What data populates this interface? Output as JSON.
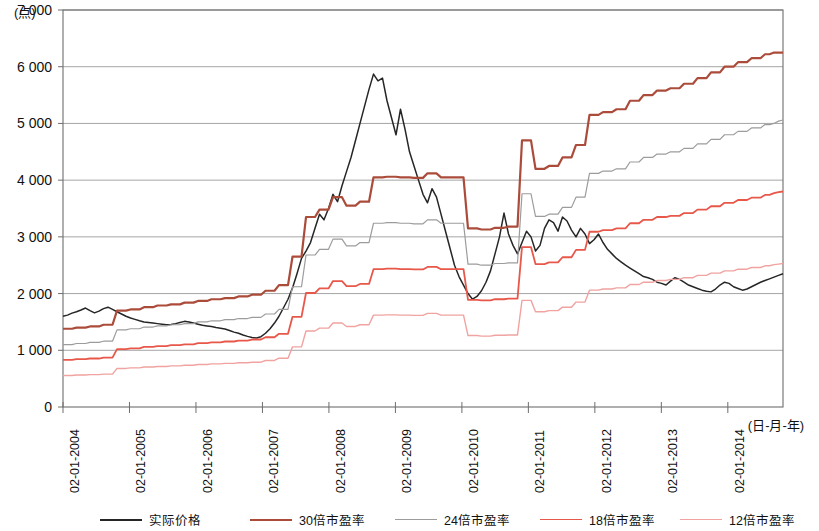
{
  "chart_data": {
    "type": "line",
    "title": "",
    "subtitle": "",
    "ylabel": "(点)",
    "xlabel": "(日-月-年)",
    "ylim": [
      0,
      7000
    ],
    "yticks": [
      0,
      1000,
      2000,
      3000,
      4000,
      5000,
      6000,
      7000
    ],
    "ytick_labels": [
      "0",
      "1 000",
      "2 000",
      "3 000",
      "4 000",
      "5 000",
      "6 000",
      "7 000"
    ],
    "xtick_labels": [
      "02-01-2004",
      "02-01-2005",
      "02-01-2006",
      "02-01-2007",
      "02-01-2008",
      "02-01-2009",
      "02-01-2010",
      "02-01-2011",
      "02-01-2012",
      "02-01-2013",
      "02-01-2014"
    ],
    "x_start_year": 2004.0,
    "x_end_year": 2014.83,
    "grid": "horizontal",
    "legend_position": "bottom",
    "series": [
      {
        "name": "实际价格",
        "color": "#262626",
        "width": 1.5,
        "values": [
          1600,
          1620,
          1655,
          1680,
          1710,
          1745,
          1700,
          1660,
          1690,
          1735,
          1760,
          1720,
          1680,
          1640,
          1600,
          1570,
          1545,
          1520,
          1500,
          1490,
          1480,
          1470,
          1460,
          1450,
          1455,
          1470,
          1490,
          1510,
          1500,
          1480,
          1460,
          1440,
          1430,
          1420,
          1400,
          1390,
          1375,
          1350,
          1320,
          1300,
          1270,
          1245,
          1225,
          1215,
          1240,
          1300,
          1380,
          1480,
          1600,
          1750,
          1900,
          2100,
          2350,
          2620,
          2750,
          2900,
          3150,
          3400,
          3300,
          3500,
          3750,
          3620,
          3900,
          4150,
          4400,
          4700,
          5000,
          5300,
          5600,
          5870,
          5750,
          5800,
          5400,
          5100,
          4800,
          5250,
          4900,
          4500,
          4250,
          4000,
          3750,
          3600,
          3850,
          3700,
          3400,
          3100,
          2800,
          2500,
          2300,
          2150,
          2000,
          1900,
          1950,
          2050,
          2200,
          2400,
          2700,
          3000,
          3420,
          3050,
          2850,
          2700,
          2900,
          3100,
          3000,
          2750,
          2850,
          3150,
          3300,
          3250,
          3100,
          3350,
          3280,
          3120,
          3000,
          3150,
          3050,
          2880,
          2950,
          3050,
          2900,
          2780,
          2700,
          2620,
          2560,
          2500,
          2450,
          2400,
          2350,
          2300,
          2280,
          2250,
          2200,
          2180,
          2150,
          2220,
          2280,
          2250,
          2200,
          2150,
          2120,
          2090,
          2060,
          2040,
          2030,
          2080,
          2150,
          2200,
          2180,
          2120,
          2090,
          2060,
          2080,
          2120,
          2160,
          2200,
          2230,
          2260,
          2290,
          2320,
          2350
        ]
      },
      {
        "name": "30倍市盈率",
        "color": "#ab4c3b",
        "width": 2.2,
        "values": [
          1380,
          1380,
          1380,
          1400,
          1400,
          1400,
          1420,
          1420,
          1420,
          1450,
          1450,
          1450,
          1700,
          1700,
          1700,
          1720,
          1720,
          1720,
          1760,
          1760,
          1760,
          1790,
          1790,
          1790,
          1810,
          1810,
          1810,
          1840,
          1840,
          1840,
          1870,
          1870,
          1870,
          1900,
          1900,
          1900,
          1920,
          1920,
          1920,
          1950,
          1950,
          1950,
          1980,
          1980,
          1980,
          2050,
          2050,
          2050,
          2150,
          2150,
          2150,
          2650,
          2650,
          2650,
          3350,
          3350,
          3350,
          3480,
          3480,
          3480,
          3700,
          3700,
          3700,
          3550,
          3550,
          3550,
          3620,
          3620,
          3620,
          4050,
          4050,
          4050,
          4060,
          4060,
          4060,
          4050,
          4050,
          4050,
          4040,
          4040,
          4040,
          4120,
          4120,
          4120,
          4050,
          4050,
          4050,
          4050,
          4050,
          4050,
          3150,
          3150,
          3150,
          3130,
          3130,
          3130,
          3160,
          3160,
          3160,
          3180,
          3180,
          3180,
          4700,
          4700,
          4700,
          4200,
          4200,
          4200,
          4250,
          4250,
          4250,
          4400,
          4400,
          4400,
          4620,
          4620,
          4620,
          5150,
          5150,
          5150,
          5200,
          5200,
          5200,
          5250,
          5250,
          5250,
          5400,
          5400,
          5400,
          5500,
          5500,
          5500,
          5580,
          5580,
          5580,
          5620,
          5620,
          5620,
          5700,
          5700,
          5700,
          5800,
          5800,
          5800,
          5900,
          5900,
          5900,
          6000,
          6000,
          6000,
          6080,
          6080,
          6080,
          6150,
          6150,
          6150,
          6220,
          6220,
          6250,
          6250,
          6250
        ]
      },
      {
        "name": "24倍市盈率",
        "color": "#9c9c9c",
        "width": 1.2,
        "values": [
          1100,
          1100,
          1100,
          1120,
          1120,
          1120,
          1140,
          1140,
          1140,
          1160,
          1160,
          1160,
          1360,
          1360,
          1360,
          1380,
          1380,
          1380,
          1410,
          1410,
          1410,
          1430,
          1430,
          1430,
          1450,
          1450,
          1450,
          1470,
          1470,
          1470,
          1500,
          1500,
          1500,
          1520,
          1520,
          1520,
          1540,
          1540,
          1540,
          1560,
          1560,
          1560,
          1580,
          1580,
          1580,
          1640,
          1640,
          1640,
          1720,
          1720,
          1720,
          2120,
          2120,
          2120,
          2680,
          2680,
          2680,
          2780,
          2780,
          2780,
          2960,
          2960,
          2960,
          2840,
          2840,
          2840,
          2900,
          2900,
          2900,
          3240,
          3240,
          3240,
          3250,
          3250,
          3250,
          3240,
          3240,
          3240,
          3230,
          3230,
          3230,
          3300,
          3300,
          3300,
          3240,
          3240,
          3240,
          3240,
          3240,
          3240,
          2520,
          2520,
          2520,
          2500,
          2500,
          2500,
          2530,
          2530,
          2530,
          2540,
          2540,
          2540,
          3760,
          3760,
          3760,
          3360,
          3360,
          3360,
          3400,
          3400,
          3400,
          3520,
          3520,
          3520,
          3700,
          3700,
          3700,
          4120,
          4120,
          4120,
          4160,
          4160,
          4160,
          4200,
          4200,
          4200,
          4320,
          4320,
          4320,
          4400,
          4400,
          4400,
          4460,
          4460,
          4460,
          4500,
          4500,
          4500,
          4560,
          4560,
          4560,
          4640,
          4640,
          4640,
          4720,
          4720,
          4720,
          4800,
          4800,
          4800,
          4860,
          4860,
          4860,
          4920,
          4920,
          4920,
          4980,
          4980,
          5000,
          5040,
          5060
        ]
      },
      {
        "name": "18倍市盈率",
        "color": "#e8584a",
        "width": 1.8,
        "values": [
          830,
          830,
          830,
          845,
          845,
          845,
          855,
          855,
          855,
          870,
          870,
          870,
          1020,
          1020,
          1020,
          1035,
          1035,
          1035,
          1060,
          1060,
          1060,
          1075,
          1075,
          1075,
          1090,
          1090,
          1090,
          1105,
          1105,
          1105,
          1125,
          1125,
          1125,
          1140,
          1140,
          1140,
          1155,
          1155,
          1155,
          1170,
          1170,
          1170,
          1190,
          1190,
          1190,
          1230,
          1230,
          1230,
          1290,
          1290,
          1290,
          1590,
          1590,
          1590,
          2010,
          2010,
          2010,
          2090,
          2090,
          2090,
          2220,
          2220,
          2220,
          2130,
          2130,
          2130,
          2170,
          2170,
          2170,
          2430,
          2430,
          2430,
          2440,
          2440,
          2440,
          2430,
          2430,
          2430,
          2425,
          2425,
          2425,
          2470,
          2470,
          2470,
          2430,
          2430,
          2430,
          2430,
          2430,
          2430,
          1890,
          1890,
          1890,
          1880,
          1880,
          1880,
          1900,
          1900,
          1900,
          1910,
          1910,
          1910,
          2820,
          2820,
          2820,
          2520,
          2520,
          2520,
          2550,
          2550,
          2550,
          2640,
          2640,
          2640,
          2770,
          2770,
          2770,
          3090,
          3090,
          3090,
          3120,
          3120,
          3120,
          3150,
          3150,
          3150,
          3240,
          3240,
          3240,
          3300,
          3300,
          3300,
          3350,
          3350,
          3350,
          3370,
          3370,
          3370,
          3420,
          3420,
          3420,
          3480,
          3480,
          3480,
          3540,
          3540,
          3540,
          3600,
          3600,
          3600,
          3650,
          3650,
          3650,
          3690,
          3690,
          3690,
          3740,
          3740,
          3770,
          3790,
          3800
        ]
      },
      {
        "name": "12倍市盈率",
        "color": "#f0a3a0",
        "width": 1.4,
        "values": [
          555,
          555,
          555,
          565,
          565,
          565,
          570,
          570,
          570,
          580,
          580,
          580,
          680,
          680,
          680,
          690,
          690,
          690,
          705,
          705,
          705,
          715,
          715,
          715,
          725,
          725,
          725,
          735,
          735,
          735,
          750,
          750,
          750,
          760,
          760,
          760,
          770,
          770,
          770,
          780,
          780,
          780,
          790,
          790,
          790,
          820,
          820,
          820,
          860,
          860,
          860,
          1060,
          1060,
          1060,
          1340,
          1340,
          1340,
          1390,
          1390,
          1390,
          1480,
          1480,
          1480,
          1420,
          1420,
          1420,
          1450,
          1450,
          1450,
          1620,
          1620,
          1620,
          1625,
          1625,
          1625,
          1620,
          1620,
          1620,
          1615,
          1615,
          1615,
          1650,
          1650,
          1650,
          1620,
          1620,
          1620,
          1620,
          1620,
          1620,
          1260,
          1260,
          1260,
          1250,
          1250,
          1250,
          1265,
          1265,
          1265,
          1270,
          1270,
          1270,
          1880,
          1880,
          1880,
          1680,
          1680,
          1680,
          1700,
          1700,
          1700,
          1760,
          1760,
          1760,
          1850,
          1850,
          1850,
          2060,
          2060,
          2060,
          2080,
          2080,
          2080,
          2100,
          2100,
          2100,
          2160,
          2160,
          2160,
          2200,
          2200,
          2200,
          2230,
          2230,
          2230,
          2250,
          2250,
          2250,
          2280,
          2280,
          2280,
          2320,
          2320,
          2320,
          2360,
          2360,
          2360,
          2400,
          2400,
          2400,
          2430,
          2430,
          2430,
          2460,
          2460,
          2460,
          2490,
          2490,
          2510,
          2520,
          2530
        ]
      }
    ]
  },
  "legend": {
    "items": [
      {
        "label": "实际价格",
        "color": "#262626",
        "width": 2.2
      },
      {
        "label": "30倍市盈率",
        "color": "#ab4c3b",
        "width": 2.2
      },
      {
        "label": "24倍市盈率",
        "color": "#9c9c9c",
        "width": 1.4
      },
      {
        "label": "18倍市盈率",
        "color": "#e8584a",
        "width": 1.8
      },
      {
        "label": "12倍市盈率",
        "color": "#f0a3a0",
        "width": 1.6
      }
    ]
  }
}
